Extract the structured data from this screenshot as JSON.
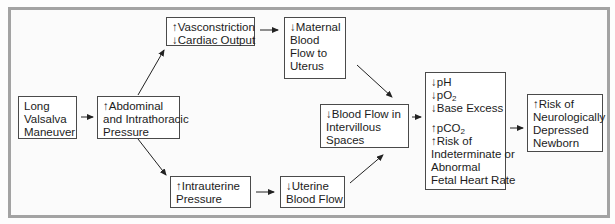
{
  "diagram": {
    "nodes": {
      "valsalva": {
        "lines": [
          "Long",
          "Valsalva",
          "Maneuver"
        ]
      },
      "abdominal": {
        "lines": [
          "↑Abdominal",
          "and Intrathoracic",
          "Pressure"
        ]
      },
      "vasoconstriction": {
        "lines": [
          "↑Vasconstriction",
          "↓Cardiac Output"
        ]
      },
      "maternal": {
        "lines": [
          "↓Maternal",
          "Blood",
          "Flow to",
          "Uterus"
        ]
      },
      "intervillous": {
        "lines": [
          "↓Blood Flow in",
          "Intervillous",
          "Spaces"
        ]
      },
      "intrauterine": {
        "lines": [
          "↑Intrauterine",
          "Pressure"
        ]
      },
      "uterine": {
        "lines": [
          "↓Uterine",
          "Blood Flow"
        ]
      },
      "fetal": {
        "group1": [
          {
            "arrow": "↓",
            "text": "pH",
            "sub": ""
          },
          {
            "arrow": "↓",
            "text": "pO",
            "sub": "2"
          },
          {
            "arrow": "↓",
            "text": "Base Excess",
            "sub": ""
          }
        ],
        "group2": [
          {
            "arrow": "↑",
            "text": "pCO",
            "sub": "2"
          }
        ],
        "risk_lines": [
          "↑Risk of",
          "Indeterminate or",
          "Abnormal",
          "Fetal Heart Rate"
        ]
      },
      "newborn": {
        "lines": [
          "↑Risk of",
          "Neurologically",
          "Depressed",
          "Newborn"
        ]
      }
    },
    "edges": [
      [
        "valsalva",
        "abdominal"
      ],
      [
        "abdominal",
        "vasoconstriction"
      ],
      [
        "abdominal",
        "intrauterine"
      ],
      [
        "vasoconstriction",
        "maternal"
      ],
      [
        "maternal",
        "fetal"
      ],
      [
        "intrauterine",
        "uterine"
      ],
      [
        "uterine",
        "intervillous"
      ],
      [
        "intervillous",
        "fetal"
      ],
      [
        "fetal",
        "newborn"
      ]
    ],
    "colors": {
      "frame": "#a3a3a3",
      "box_border": "#4a4a4a",
      "arrow": "#222222"
    }
  }
}
